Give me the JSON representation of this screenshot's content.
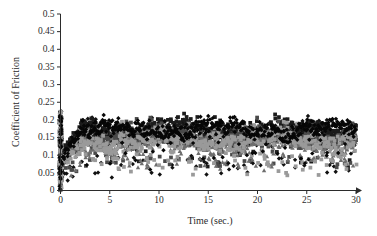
{
  "chart_data": {
    "type": "scatter",
    "title": "",
    "xlabel": "Time (sec.)",
    "ylabel": "Coefficient of Friction",
    "xlim": [
      0,
      30
    ],
    "ylim": [
      0,
      0.5
    ],
    "xticks": [
      0,
      5,
      10,
      15,
      20,
      25,
      30
    ],
    "yticks": [
      0,
      0.05,
      0.1,
      0.15,
      0.2,
      0.25,
      0.3,
      0.35,
      0.4,
      0.45,
      0.5
    ],
    "xticklabels": [
      "0",
      "5",
      "10",
      "15",
      "20",
      "25",
      "30"
    ],
    "yticklabels": [
      "0",
      "0.05",
      "0.1",
      "0.15",
      "0.2",
      "0.25",
      "0.3",
      "0.35",
      "0.4",
      "0.45",
      "0.5"
    ],
    "grid": false,
    "legend": "none",
    "marker_size": 2.2,
    "point_count_per_series": 520,
    "series": [
      {
        "name": "series-1-black-diamond",
        "color": "#111111",
        "marker": "diamond",
        "mean": 0.158,
        "spread": 0.03,
        "outlier_low_rate": 0.1,
        "outlier_low_mean": 0.072,
        "startup_spike": true,
        "seed": 1037
      },
      {
        "name": "series-2-black-square",
        "color": "#1c1c1c",
        "marker": "square",
        "mean": 0.168,
        "spread": 0.026,
        "outlier_low_rate": 0.05,
        "outlier_low_mean": 0.095,
        "startup_spike": true,
        "seed": 2213
      },
      {
        "name": "series-3-darkgray",
        "color": "#4a4a4a",
        "marker": "square",
        "mean": 0.152,
        "spread": 0.028,
        "outlier_low_rate": 0.08,
        "outlier_low_mean": 0.088,
        "startup_spike": true,
        "seed": 3391
      },
      {
        "name": "series-4-midgray-triangle",
        "color": "#6e6e6e",
        "marker": "triangle",
        "mean": 0.135,
        "spread": 0.027,
        "outlier_low_rate": 0.12,
        "outlier_low_mean": 0.082,
        "startup_spike": true,
        "seed": 4517
      },
      {
        "name": "series-5-lightgray",
        "color": "#9a9a9a",
        "marker": "square",
        "mean": 0.142,
        "spread": 0.031,
        "outlier_low_rate": 0.1,
        "outlier_low_mean": 0.08,
        "startup_spike": true,
        "seed": 5623
      },
      {
        "name": "series-6-black-dense",
        "color": "#070707",
        "marker": "diamond",
        "mean": 0.172,
        "spread": 0.023,
        "outlier_low_rate": 0.04,
        "outlier_low_mean": 0.1,
        "startup_spike": true,
        "seed": 6781
      }
    ],
    "band_summary": {
      "main_band_low": 0.11,
      "main_band_high": 0.21,
      "center": 0.155,
      "max_observed": 0.26,
      "min_observed": 0.02,
      "startup_spike_time": 0.0,
      "startup_spike_range": [
        0.0,
        0.225
      ]
    }
  },
  "axes": {
    "y_title": "Coefficient of Friction",
    "x_title": "Time (sec.)"
  }
}
